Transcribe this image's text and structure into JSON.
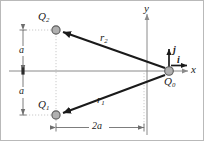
{
  "figure": {
    "colors": {
      "axis": "#8a8a8a",
      "vector": "#1a1a1a",
      "charge_fill": "#b0b0b0",
      "charge_stroke": "#5a5a5a",
      "guide": "#c4c4c4",
      "dimension": "#6e6e6e",
      "frame": "#b9b9b9",
      "text": "#1a1a1a"
    }
  },
  "axes": {
    "x_label": "x",
    "y_label": "y",
    "x_axis_name": "horizontal-axis",
    "y_axis_name": "vertical-axis"
  },
  "unit_vectors": [
    {
      "label": "i",
      "direction": "right",
      "name": "unit-vector-i"
    },
    {
      "label": "j",
      "direction": "up",
      "name": "unit-vector-j"
    }
  ],
  "charges": [
    {
      "id": "Q2",
      "base": "Q",
      "sub": "2",
      "label": "Q2",
      "x": 55,
      "y": 29,
      "position_note": "upper-left"
    },
    {
      "id": "Q1",
      "base": "Q",
      "sub": "1",
      "label": "Q1",
      "x": 55,
      "y": 114,
      "position_note": "lower-left"
    },
    {
      "id": "Q0",
      "base": "Q",
      "sub": "0",
      "label": "Q0",
      "x": 168,
      "y": 70,
      "position_note": "origin"
    }
  ],
  "vectors": [
    {
      "id": "r2",
      "base": "r",
      "sub": "2",
      "from": "Q0",
      "to": "Q2",
      "name": "vector-r2"
    },
    {
      "id": "r1",
      "base": "r",
      "sub": "1",
      "from": "Q0",
      "to": "Q1",
      "name": "vector-r1"
    }
  ],
  "dimensions": [
    {
      "id": "a-upper",
      "label": "a",
      "orientation": "vertical",
      "span": "origin-to-Q2-height"
    },
    {
      "id": "a-lower",
      "label": "a",
      "orientation": "vertical",
      "span": "origin-to-Q1-height"
    },
    {
      "id": "2a",
      "label": "2a",
      "orientation": "horizontal",
      "span": "Q1-to-origin-width"
    }
  ]
}
